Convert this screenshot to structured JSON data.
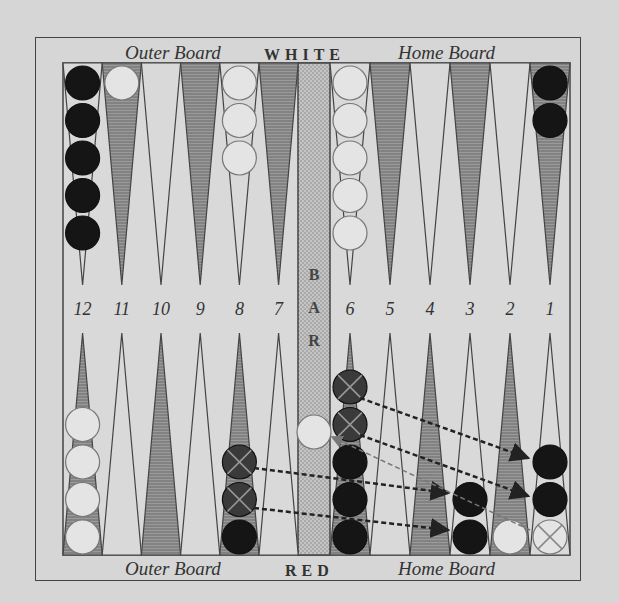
{
  "labels": {
    "top_left": "Outer Board",
    "top_center": "WHITE",
    "top_right": "Home Board",
    "bottom_left": "Outer Board",
    "bottom_center": "RED",
    "bottom_right": "Home Board",
    "bar": "BAR"
  },
  "point_numbers": [
    "12",
    "11",
    "10",
    "9",
    "8",
    "7",
    "6",
    "5",
    "4",
    "3",
    "2",
    "1"
  ],
  "colors": {
    "background": "#d6d6d6",
    "line": "#444444",
    "black_checker": "#151515",
    "white_checker": "#e4e4e4",
    "shaded_point": "#8a8a8a"
  },
  "checkers": {
    "top": {
      "12": {
        "color": "black",
        "count": 5
      },
      "11": {
        "color": "white",
        "count": 1
      },
      "8": {
        "color": "white",
        "count": 3
      },
      "6": {
        "color": "white",
        "count": 5
      },
      "1": {
        "color": "black",
        "count": 2
      }
    },
    "bottom": {
      "12": {
        "color": "white",
        "count": 4
      },
      "8": {
        "color": "black",
        "count": 3,
        "moved_away": 2
      },
      "6": {
        "color": "black",
        "count": 5,
        "moved_away": 2
      },
      "3": {
        "color": "black",
        "count": 2
      },
      "2": {
        "color": "white",
        "count": 1
      },
      "1": {
        "color": "black",
        "count": 2,
        "hit_white": 1
      }
    },
    "bar": {
      "color": "white",
      "count": 1
    }
  },
  "moves": [
    {
      "from": "8",
      "to": "3"
    },
    {
      "from": "8",
      "to": "3"
    },
    {
      "from": "6",
      "to": "1"
    },
    {
      "from": "6",
      "to": "1"
    },
    {
      "from": "1",
      "to": "bar",
      "note": "hit white checker"
    }
  ]
}
